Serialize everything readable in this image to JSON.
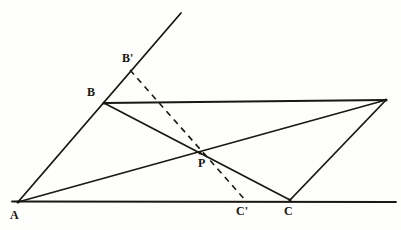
{
  "figure": {
    "background_color": "#fefefd",
    "stroke_color": "#1a1813",
    "canvas": {
      "width": 401,
      "height": 230
    }
  },
  "points": {
    "A": {
      "label": "A",
      "x": 18,
      "y": 202
    },
    "B": {
      "label": "B",
      "x": 104,
      "y": 103
    },
    "Bprime": {
      "label": "B'",
      "x": 130,
      "y": 68
    },
    "C": {
      "label": "C",
      "x": 290,
      "y": 200
    },
    "Cprime": {
      "label": "C'",
      "x": 245,
      "y": 200
    },
    "D": {
      "label": "",
      "x": 386,
      "y": 100
    },
    "P": {
      "label": "P",
      "x": 200,
      "y": 153
    }
  },
  "labels": [
    {
      "name": "label-A",
      "text": "A",
      "x": 10,
      "y": 209
    },
    {
      "name": "label-B",
      "text": "B",
      "x": 87,
      "y": 86
    },
    {
      "name": "label-B-prime",
      "text": "B'",
      "x": 122,
      "y": 52
    },
    {
      "name": "label-P",
      "text": "P",
      "x": 198,
      "y": 157
    },
    {
      "name": "label-C-prime",
      "text": "C'",
      "x": 236,
      "y": 205
    },
    {
      "name": "label-C",
      "text": "C",
      "x": 284,
      "y": 205
    }
  ],
  "segments": [
    {
      "name": "ray-A-through-B",
      "from": [
        18,
        202
      ],
      "to": [
        181,
        13
      ],
      "style": "solid",
      "width": 1.7
    },
    {
      "name": "baseline-through-A-C",
      "from": [
        12,
        201
      ],
      "to": [
        396,
        202
      ],
      "style": "solid",
      "width": 1.7
    },
    {
      "name": "segment-B-D",
      "from": [
        104,
        103
      ],
      "to": [
        386,
        100
      ],
      "style": "solid",
      "width": 1.7
    },
    {
      "name": "segment-A-D",
      "from": [
        18,
        202
      ],
      "to": [
        386,
        100
      ],
      "style": "solid",
      "width": 1.7
    },
    {
      "name": "segment-B-C",
      "from": [
        104,
        103
      ],
      "to": [
        290,
        200
      ],
      "style": "solid",
      "width": 1.7
    },
    {
      "name": "segment-C-D",
      "from": [
        290,
        200
      ],
      "to": [
        386,
        100
      ],
      "style": "solid",
      "width": 1.7
    },
    {
      "name": "dashed-B-prime-to-C-prime",
      "from": [
        130,
        70
      ],
      "to": [
        246,
        201
      ],
      "style": "dashed",
      "width": 1.6,
      "dash": "6 5"
    }
  ]
}
